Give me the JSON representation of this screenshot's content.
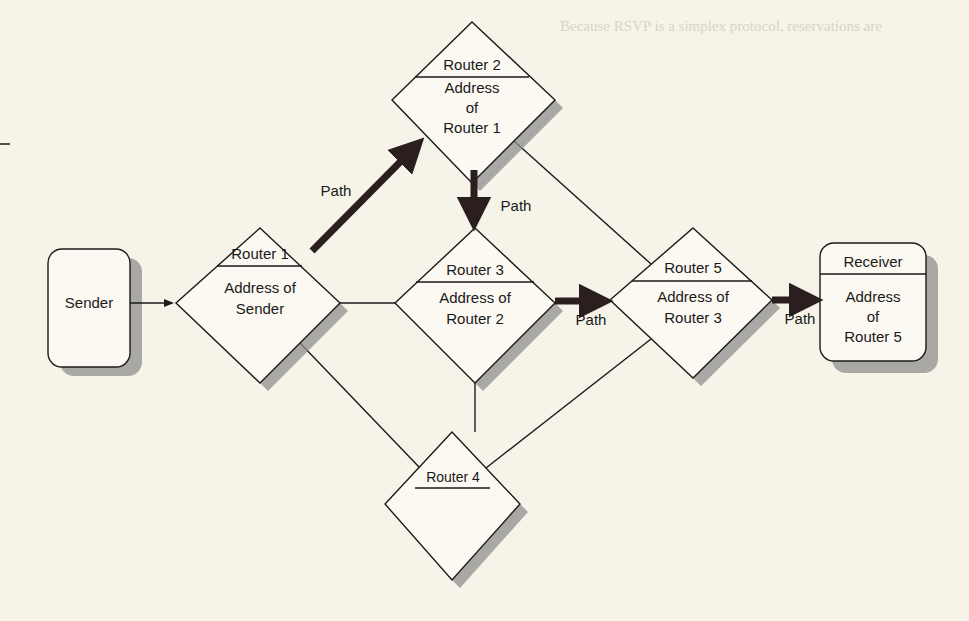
{
  "figure": {
    "nodes": {
      "sender": {
        "title": "Sender"
      },
      "router1": {
        "title": "Router 1",
        "body_line1": "Address of",
        "body_line2": "Sender"
      },
      "router2": {
        "title": "Router 2",
        "body_line1": "Address",
        "body_line2": "of",
        "body_line3": "Router 1"
      },
      "router3": {
        "title": "Router 3",
        "body_line1": "Address of",
        "body_line2": "Router 2"
      },
      "router4": {
        "title": "Router 4"
      },
      "router5": {
        "title": "Router 5",
        "body_line1": "Address of",
        "body_line2": "Router 3"
      },
      "receiver": {
        "title": "Receiver",
        "body_line1": "Address",
        "body_line2": "of",
        "body_line3": "Router 5"
      }
    },
    "path_labels": {
      "r1_to_r2": "Path",
      "r2_to_r3": "Path",
      "r3_to_r5": "Path",
      "r5_to_receiver": "Path"
    },
    "colors": {
      "background": "#f6f3e8",
      "shape_fill": "#fbf9f1",
      "line": "#1a1a1a",
      "shadow": "#8f8f8f",
      "path_arrow": "#2a1e1e"
    }
  }
}
